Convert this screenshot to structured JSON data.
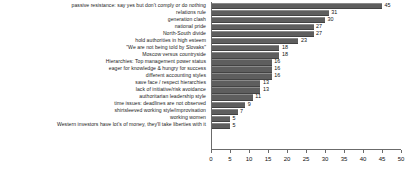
{
  "chart_data": {
    "type": "bar",
    "orientation": "horizontal",
    "title": "",
    "subtitle": "",
    "xlabel": "",
    "ylabel": "",
    "xlim": [
      0,
      50
    ],
    "xticks": [
      0,
      5,
      10,
      15,
      20,
      25,
      30,
      35,
      40,
      45,
      50
    ],
    "xtick_labels": [
      "0",
      "5",
      "10",
      "15",
      "20",
      "25",
      "30",
      "35",
      "40",
      "45",
      "50"
    ],
    "grid": false,
    "legend": null,
    "bar_color": "#5e5e5e",
    "show_value_labels": true,
    "categories": [
      "passive resistance: say yes but don't comply or do nothing",
      "relations rule",
      "generation clash",
      "national pride",
      "North-South divide",
      "hold authorities in high esteem",
      "\"We are not being told by Slovaks\"",
      "Moscow versus countryside",
      "Hierarchies: Top management power status",
      "eager for knowledge & hungry for success",
      "different accounting styles",
      "save face / respect hierarchies",
      "lack of initiative/risk avoidance",
      "authoritarian leadership style",
      "time issues: deadlines are not observed",
      "shirtsleeved working style/improvisation",
      "working women",
      "Western investors have lot's of money, they'll take liberties with it"
    ],
    "values": [
      45,
      31,
      30,
      27,
      27,
      23,
      18,
      18,
      16,
      16,
      16,
      13,
      13,
      11,
      9,
      7,
      5,
      5
    ],
    "value_labels": [
      "45",
      "31",
      "30",
      "27",
      "27",
      "23",
      "18",
      "18",
      "16",
      "16",
      "16",
      "13",
      "13",
      "11",
      "9",
      "7",
      "5",
      "5"
    ]
  }
}
